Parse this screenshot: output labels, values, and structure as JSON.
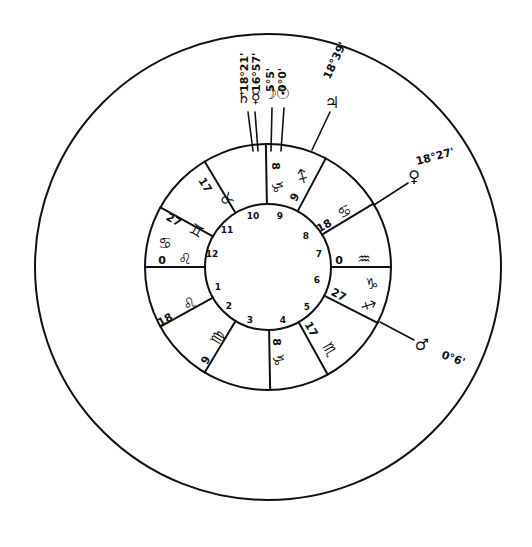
{
  "chart": {
    "center": [
      268,
      267
    ],
    "radii": {
      "outer": 233,
      "middle": 123,
      "inner": 63
    },
    "ink_color": "#111111",
    "background": "#ffffff"
  },
  "houses": [
    {
      "n": "1",
      "x": 218,
      "y": 290
    },
    {
      "n": "2",
      "x": 229,
      "y": 309
    },
    {
      "n": "3",
      "x": 250,
      "y": 323
    },
    {
      "n": "4",
      "x": 283,
      "y": 323
    },
    {
      "n": "5",
      "x": 307,
      "y": 310
    },
    {
      "n": "6",
      "x": 317,
      "y": 283
    },
    {
      "n": "7",
      "x": 319,
      "y": 257
    },
    {
      "n": "8",
      "x": 306,
      "y": 239
    },
    {
      "n": "9",
      "x": 280,
      "y": 219
    },
    {
      "n": "10",
      "x": 253,
      "y": 219
    },
    {
      "n": "11",
      "x": 227,
      "y": 233
    },
    {
      "n": "12",
      "x": 212,
      "y": 257
    }
  ],
  "cusp_angles_deg": [
    0,
    -31,
    -62,
    -91,
    -121,
    -151,
    180,
    151,
    121,
    89,
    61,
    27
  ],
  "cusp_labels": [
    {
      "id": "cusp-11",
      "deg": "17",
      "sign": "♉",
      "x": 202,
      "y": 187,
      "rot": 58,
      "sx": 222,
      "sy": 202
    },
    {
      "id": "cusp-12",
      "deg": "27",
      "sign": "♊",
      "x": 172,
      "y": 223,
      "rot": 30,
      "sx": 194,
      "sy": 235
    },
    {
      "id": "cusp-asc-cancer",
      "deg": "",
      "sign": "♋",
      "x": 165,
      "y": 248,
      "rot": 0,
      "sx": 165,
      "sy": 248
    },
    {
      "id": "cusp-1",
      "deg": "0",
      "sign": "♌",
      "x": 162,
      "y": 264,
      "rot": 0,
      "sx": 185,
      "sy": 264
    },
    {
      "id": "cusp-2",
      "deg": "18",
      "sign": "♌",
      "x": 167,
      "y": 323,
      "rot": -30,
      "sx": 192,
      "sy": 308
    },
    {
      "id": "cusp-3",
      "deg": "9",
      "sign": "♍",
      "x": 209,
      "y": 362,
      "rot": -60,
      "sx": 222,
      "sy": 340
    },
    {
      "id": "cusp-4",
      "deg": "8",
      "sign": "♑",
      "x": 273,
      "y": 342,
      "rot": 90,
      "sx": 273,
      "sy": 360
    },
    {
      "id": "cusp-5",
      "deg": "17",
      "sign": "♏",
      "x": 308,
      "y": 331,
      "rot": 60,
      "sx": 325,
      "sy": 352
    },
    {
      "id": "cusp-6",
      "deg": "27",
      "sign": "♐",
      "x": 337,
      "y": 298,
      "rot": 27,
      "sx": 366,
      "sy": 310
    },
    {
      "id": "cusp-6b",
      "deg": "",
      "sign": "♑",
      "x": 372,
      "y": 289,
      "rot": 0,
      "sx": 372,
      "sy": 289
    },
    {
      "id": "cusp-7",
      "deg": "0",
      "sign": "♒",
      "x": 339,
      "y": 264,
      "rot": 0,
      "sx": 364,
      "sy": 264
    },
    {
      "id": "cusp-8",
      "deg": "18",
      "sign": "♋",
      "x": 326,
      "y": 229,
      "rot": -30,
      "sx": 347,
      "sy": 216
    },
    {
      "id": "cusp-9",
      "deg": "9",
      "sign": "♐",
      "x": 298,
      "y": 199,
      "rot": -60,
      "sx": 307,
      "sy": 179
    },
    {
      "id": "cusp-10",
      "deg": "8",
      "sign": "♑",
      "x": 272,
      "y": 166,
      "rot": 90,
      "sx": 272,
      "sy": 187
    }
  ],
  "planets": [
    {
      "id": "saturn",
      "glyph": "♄",
      "x1": 253,
      "y1": 151,
      "x2": 248,
      "y2": 112,
      "gx": 244,
      "gy": 103,
      "label": "18°21'",
      "lx": 244,
      "ly": 48
    },
    {
      "id": "mercury",
      "glyph": "☿",
      "x1": 258,
      "y1": 151,
      "x2": 255,
      "y2": 112,
      "gx": 256,
      "gy": 103,
      "label": "16°57'",
      "lx": 256,
      "ly": 48
    },
    {
      "id": "moon",
      "glyph": "☽",
      "x1": 271,
      "y1": 151,
      "x2": 272,
      "y2": 108,
      "gx": 270,
      "gy": 99,
      "label": "5°5'",
      "lx": 270,
      "ly": 48
    },
    {
      "id": "sun",
      "glyph": "☉",
      "x1": 281,
      "y1": 151,
      "x2": 284,
      "y2": 108,
      "gx": 283,
      "gy": 99,
      "label": "0°0'",
      "lx": 282,
      "ly": 48
    },
    {
      "id": "jupiter",
      "glyph": "♃",
      "x1": 312,
      "y1": 150,
      "x2": 330,
      "y2": 112,
      "gx": 332,
      "gy": 108,
      "label": "18°39'",
      "lx": 338,
      "ly": 62
    },
    {
      "id": "venus",
      "glyph": "♀",
      "x1": 374,
      "y1": 205,
      "x2": 408,
      "y2": 183,
      "gx": 414,
      "gy": 182,
      "label": "18°27'",
      "lx": 436,
      "ly": 160
    },
    {
      "id": "mars",
      "glyph": "♂",
      "x1": 380,
      "y1": 322,
      "x2": 414,
      "y2": 340,
      "gx": 422,
      "gy": 350,
      "label": "0°6'",
      "lx": 452,
      "ly": 362
    }
  ]
}
